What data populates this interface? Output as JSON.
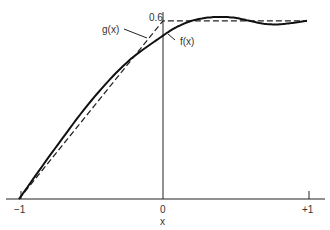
{
  "chart_data": {
    "type": "line",
    "title": "",
    "xlabel": "x",
    "ylabel": "",
    "xlim": [
      -1,
      1
    ],
    "ylim": [
      0,
      0.6
    ],
    "x_ticks": [
      "-1",
      "0",
      "+1"
    ],
    "y_ticks": [
      "0.6"
    ],
    "grid": false,
    "legend": "none (curves labeled by annotation)",
    "series": [
      {
        "name": "f(x)",
        "style": "solid",
        "x": [
          -1,
          -0.75,
          -0.5,
          -0.25,
          0,
          0.1,
          0.2,
          0.3,
          0.4,
          0.5,
          0.6,
          0.7,
          0.8,
          0.9,
          1.0
        ],
        "y": [
          0,
          0.17,
          0.33,
          0.46,
          0.55,
          0.58,
          0.6,
          0.61,
          0.613,
          0.61,
          0.6,
          0.59,
          0.588,
          0.593,
          0.6
        ]
      },
      {
        "name": "g(x)",
        "style": "dashed",
        "x": [
          -1,
          0,
          1
        ],
        "y": [
          0,
          0.6,
          0.6
        ]
      }
    ],
    "annotations": [
      "g(x)",
      "f(x)",
      "0.6"
    ]
  },
  "labels": {
    "x_tick_neg1": "−1",
    "x_tick_0": "0",
    "x_tick_pos1": "+1",
    "x_axis_label": "x",
    "y_tick_06": "0.6",
    "g_label": "g(x)",
    "f_label": "f(x)"
  }
}
